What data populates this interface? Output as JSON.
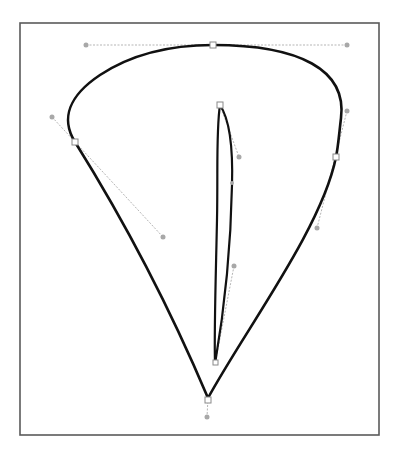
{
  "figure": {
    "colors": {
      "background": "#ffffff",
      "frame_stroke": "#5a5a5a",
      "path_stroke": "#111111",
      "handle_line": "#b5b5b5",
      "handle_dot": "#a8a8a8",
      "anchor_fill": "#ffffff",
      "anchor_stroke": "#8a8a8a"
    },
    "frame": {
      "x": 20,
      "y": 23,
      "width": 359,
      "height": 412
    },
    "outer_path": {
      "anchors": [
        {
          "name": "top",
          "x": 213,
          "y": 45,
          "handle_in": [
            86,
            45
          ],
          "handle_out": [
            347,
            45
          ]
        },
        {
          "name": "right",
          "x": 336,
          "y": 157,
          "handle_in": [
            347,
            111
          ],
          "handle_out": [
            317,
            228
          ]
        },
        {
          "name": "bottom-tip",
          "x": 208,
          "y": 398,
          "handle_out": [
            207,
            417
          ]
        },
        {
          "name": "left",
          "x": 75,
          "y": 142,
          "handle_in": [
            163,
            237
          ],
          "handle_out": [
            52,
            117
          ]
        }
      ]
    },
    "inner_path": {
      "anchors": [
        {
          "name": "inner-top",
          "x": 220,
          "y": 105,
          "handle_out": [
            239,
            157
          ]
        },
        {
          "name": "inner-mid",
          "x": 232,
          "y": 183
        },
        {
          "name": "inner-lower",
          "x": 234,
          "y": 266
        },
        {
          "name": "inner-bottom",
          "x": 215,
          "y": 364
        }
      ]
    }
  }
}
